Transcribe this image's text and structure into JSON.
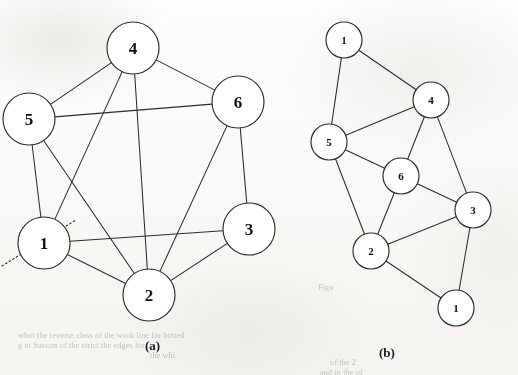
{
  "figure": {
    "background_color": "#fdfdfc",
    "stroke_color": "#2b2b2b",
    "node_fill": "#ffffff",
    "label_color": "#111111"
  },
  "panels": [
    {
      "id": "panel-a",
      "caption": "(a)",
      "caption_pos": {
        "x": 145,
        "y": 338
      },
      "node_radius": 26,
      "nodes": [
        {
          "id": "a4",
          "label": "4",
          "x": 133,
          "y": 48
        },
        {
          "id": "a5",
          "label": "5",
          "x": 29,
          "y": 119
        },
        {
          "id": "a6",
          "label": "6",
          "x": 238,
          "y": 102
        },
        {
          "id": "a3",
          "label": "3",
          "x": 249,
          "y": 229
        },
        {
          "id": "a1",
          "label": "1",
          "x": 44,
          "y": 243
        },
        {
          "id": "a2",
          "label": "2",
          "x": 149,
          "y": 295
        }
      ],
      "edges": [
        {
          "from": "a4",
          "to": "a5"
        },
        {
          "from": "a4",
          "to": "a6"
        },
        {
          "from": "a4",
          "to": "a1"
        },
        {
          "from": "a4",
          "to": "a2"
        },
        {
          "from": "a5",
          "to": "a6"
        },
        {
          "from": "a5",
          "to": "a1"
        },
        {
          "from": "a5",
          "to": "a2"
        },
        {
          "from": "a6",
          "to": "a3"
        },
        {
          "from": "a6",
          "to": "a2"
        },
        {
          "from": "a3",
          "to": "a1"
        },
        {
          "from": "a3",
          "to": "a2"
        },
        {
          "from": "a1",
          "to": "a2"
        }
      ],
      "annotations": [
        {
          "id": "cut-line",
          "kind": "dotted-line",
          "x1": 2,
          "y1": 266,
          "x2": 76,
          "y2": 220
        }
      ]
    },
    {
      "id": "panel-b",
      "caption": "(b)",
      "caption_pos": {
        "x": 379,
        "y": 345
      },
      "node_radius": 18,
      "nodes": [
        {
          "id": "b1t",
          "label": "1",
          "x": 344,
          "y": 40
        },
        {
          "id": "b4",
          "label": "4",
          "x": 431,
          "y": 100
        },
        {
          "id": "b5",
          "label": "5",
          "x": 329,
          "y": 142
        },
        {
          "id": "b6",
          "label": "6",
          "x": 401,
          "y": 176
        },
        {
          "id": "b3",
          "label": "3",
          "x": 473,
          "y": 210
        },
        {
          "id": "b2",
          "label": "2",
          "x": 371,
          "y": 251
        },
        {
          "id": "b1b",
          "label": "1",
          "x": 456,
          "y": 308
        }
      ],
      "edges": [
        {
          "from": "b1t",
          "to": "b4"
        },
        {
          "from": "b1t",
          "to": "b5"
        },
        {
          "from": "b5",
          "to": "b4"
        },
        {
          "from": "b5",
          "to": "b6"
        },
        {
          "from": "b5",
          "to": "b2"
        },
        {
          "from": "b4",
          "to": "b6"
        },
        {
          "from": "b4",
          "to": "b3"
        },
        {
          "from": "b6",
          "to": "b2"
        },
        {
          "from": "b6",
          "to": "b3"
        },
        {
          "from": "b3",
          "to": "b2"
        },
        {
          "from": "b3",
          "to": "b1b"
        },
        {
          "from": "b2",
          "to": "b1b"
        }
      ],
      "annotations": []
    }
  ],
  "bleed_through_text": [
    {
      "id": "bt-1",
      "text": "whot the reverse class of the work line for hotted",
      "x": 18,
      "y": 331
    },
    {
      "id": "bt-2",
      "text": "g       to  Suscon of the strict  the edges  for",
      "x": 18,
      "y": 341
    },
    {
      "id": "bt-3",
      "text": "the  whi",
      "x": 150,
      "y": 351
    },
    {
      "id": "bt-4",
      "text": "Figu",
      "x": 318,
      "y": 283
    },
    {
      "id": "bt-5",
      "text": "of  the   2",
      "x": 330,
      "y": 358
    },
    {
      "id": "bt-6",
      "text": "and    in   the   of",
      "x": 320,
      "y": 368
    }
  ],
  "chart_data": {
    "type": "diagram",
    "subtype": "graph-isomorphism",
    "panels": [
      "(a)",
      "(b)"
    ],
    "panel_a": {
      "vertices": [
        "1",
        "2",
        "3",
        "4",
        "5",
        "6"
      ],
      "edge_list": [
        [
          "4",
          "5"
        ],
        [
          "4",
          "6"
        ],
        [
          "4",
          "1"
        ],
        [
          "4",
          "2"
        ],
        [
          "5",
          "6"
        ],
        [
          "5",
          "1"
        ],
        [
          "5",
          "2"
        ],
        [
          "6",
          "3"
        ],
        [
          "6",
          "2"
        ],
        [
          "3",
          "1"
        ],
        [
          "3",
          "2"
        ],
        [
          "1",
          "2"
        ]
      ],
      "edge_count": 12,
      "vertex_count": 6,
      "layout": "circular",
      "annotation": "dotted line through vertex 1"
    },
    "panel_b": {
      "vertices": [
        "1",
        "4",
        "5",
        "6",
        "3",
        "2",
        "1"
      ],
      "edge_list": [
        [
          "1",
          "4"
        ],
        [
          "1",
          "5"
        ],
        [
          "5",
          "4"
        ],
        [
          "5",
          "6"
        ],
        [
          "5",
          "2"
        ],
        [
          "4",
          "6"
        ],
        [
          "4",
          "3"
        ],
        [
          "6",
          "2"
        ],
        [
          "6",
          "3"
        ],
        [
          "3",
          "2"
        ],
        [
          "3",
          "1"
        ],
        [
          "2",
          "1"
        ]
      ],
      "edge_count": 12,
      "vertex_count": 7,
      "layout": "planar-split",
      "annotation": "vertex 1 duplicated (split) into two copies"
    }
  }
}
